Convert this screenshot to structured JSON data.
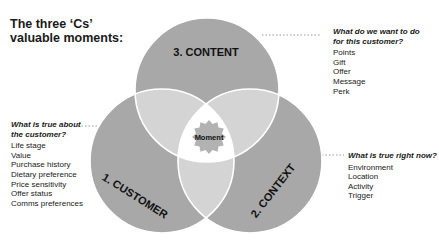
{
  "title": "The three ‘Cs’ valuable moments:",
  "title_lines": [
    "The three ‘Cs’",
    "valuable moments:"
  ],
  "colors": {
    "circle": "#a8a8a8",
    "overlap": "#d4d4d4",
    "center": "#ffffff",
    "star": "#b2b2b2",
    "dotted_line": "#9a9a9a"
  },
  "circles": {
    "content": {
      "label": "3. CONTENT"
    },
    "customer": {
      "label": "1. CUSTOMER"
    },
    "context": {
      "label": "2. CONTEXT"
    }
  },
  "center": {
    "label": "Moment"
  },
  "content_block": {
    "question_lines": [
      "What do we want to do",
      "for this customer?"
    ],
    "items": [
      "Points",
      "Gift",
      "Offer",
      "Message",
      "Perk"
    ]
  },
  "customer_block": {
    "question_lines": [
      "What is true about",
      "the customer?"
    ],
    "items": [
      "Life stage",
      "Value",
      "Purchase history",
      "Dietary preference",
      "Price sensitivity",
      "Offer status",
      "Comms preferences"
    ]
  },
  "context_block": {
    "question_lines": [
      "What is true right now?"
    ],
    "items": [
      "Environment",
      "Location",
      "Activity",
      "Trigger"
    ]
  }
}
